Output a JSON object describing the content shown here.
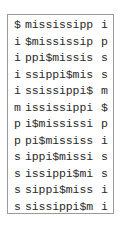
{
  "matrix": {
    "rows": [
      {
        "first": "$",
        "middle": "mississipp",
        "last": "i"
      },
      {
        "first": "i",
        "middle": "$mississip",
        "last": "p"
      },
      {
        "first": "i",
        "middle": "ppi$missis",
        "last": "s"
      },
      {
        "first": "i",
        "middle": "ssippi$mis",
        "last": "s"
      },
      {
        "first": "i",
        "middle": "ssissippi$",
        "last": "m"
      },
      {
        "first": "m",
        "middle": "ississippi",
        "last": "$"
      },
      {
        "first": "p",
        "middle": "i$mississi",
        "last": "p"
      },
      {
        "first": "p",
        "middle": "pi$mississ",
        "last": "i"
      },
      {
        "first": "s",
        "middle": "ippi$missi",
        "last": "s"
      },
      {
        "first": "s",
        "middle": "issippi$mi",
        "last": "s"
      },
      {
        "first": "s",
        "middle": "sippi$miss",
        "last": "i"
      },
      {
        "first": "s",
        "middle": "sissippi$m",
        "last": "i"
      }
    ]
  }
}
